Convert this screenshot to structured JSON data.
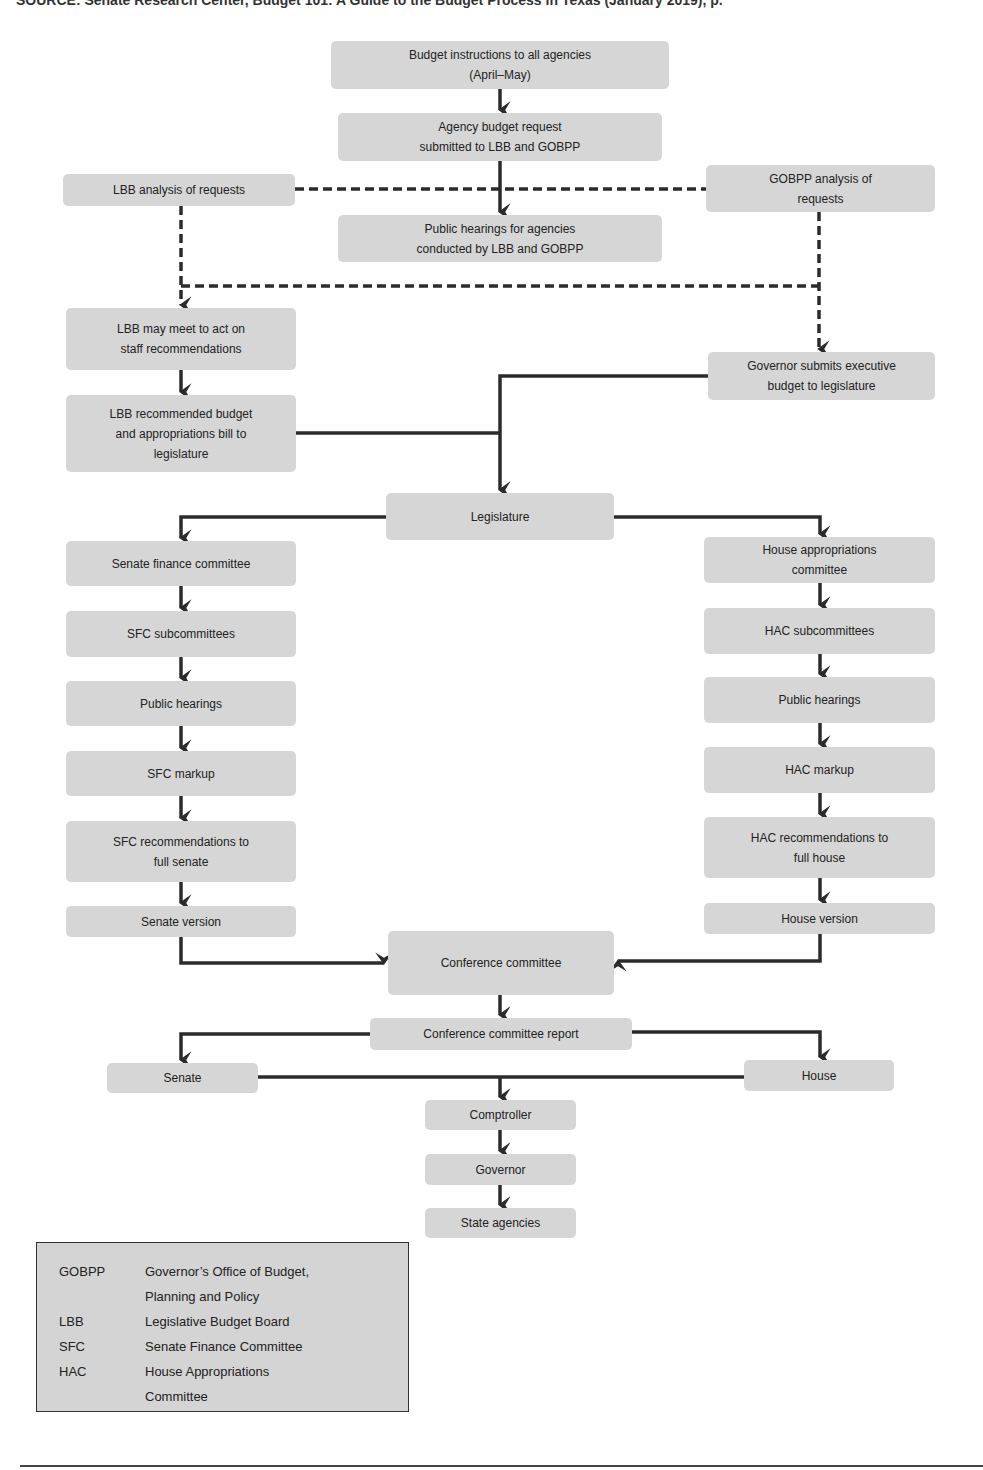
{
  "source_line": "SOURCE: Senate Research Center, Budget 101: A Guide to the Budget Process in Texas (January 2019), p.",
  "colors": {
    "box_fill": "#d6d6d6",
    "connector": "#2b2b2b",
    "legend_fill": "#d4d4d4"
  },
  "nodes": {
    "budget_instructions": "Budget instructions to all agencies\n(April–May)",
    "agency_request": "Agency budget request\nsubmitted to LBB and GOBPP",
    "lbb_analysis": "LBB analysis of requests",
    "gobpp_analysis": "GOBPP analysis of\nrequests",
    "public_hearings_agencies": "Public hearings for agencies\nconducted by LBB and GOBPP",
    "lbb_meet": "LBB may meet to act on\nstaff recommendations",
    "governor_submits": "Governor submits executive\nbudget to legislature",
    "lbb_recommended": "LBB recommended budget\nand appropriations bill to\nlegislature",
    "legislature": "Legislature",
    "senate_finance": "Senate finance committee",
    "house_appropriations": "House appropriations\ncommittee",
    "sfc_subcommittees": "SFC subcommittees",
    "hac_subcommittees": "HAC subcommittees",
    "senate_public_hearings": "Public hearings",
    "house_public_hearings": "Public hearings",
    "sfc_markup": "SFC markup",
    "hac_markup": "HAC markup",
    "sfc_recommendations": "SFC recommendations to\nfull senate",
    "hac_recommendations": "HAC recommendations to\nfull house",
    "senate_version": "Senate version",
    "house_version": "House version",
    "conference_committee": "Conference committee",
    "conference_report": "Conference committee report",
    "senate": "Senate",
    "house": "House",
    "comptroller": "Comptroller",
    "governor": "Governor",
    "state_agencies": "State agencies"
  },
  "legend": [
    {
      "abbr": "GOBPP",
      "definition": "Governor’s Office of Budget,\nPlanning and Policy"
    },
    {
      "abbr": "LBB",
      "definition": "Legislative Budget Board"
    },
    {
      "abbr": "SFC",
      "definition": "Senate Finance Committee"
    },
    {
      "abbr": "HAC",
      "definition": "House Appropriations\nCommittee"
    }
  ]
}
